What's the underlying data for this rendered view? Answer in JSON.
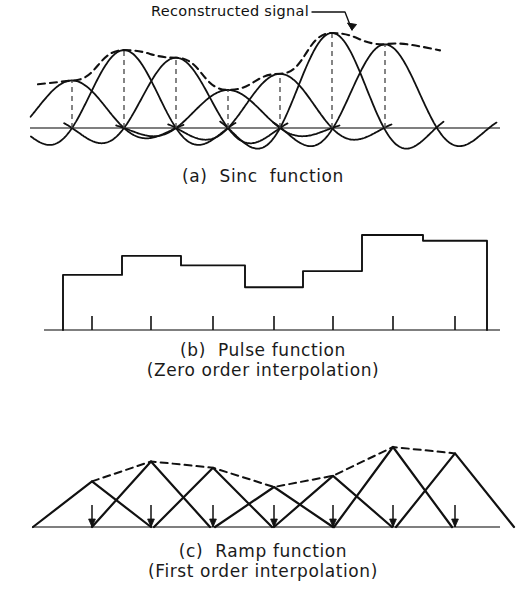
{
  "figure": {
    "stroke_color": "#111111",
    "dashed_color": "#111111",
    "baseline_color": "#555555"
  },
  "annotations": {
    "reconstructed_signal": {
      "text": "Reconstructed signal",
      "leader": "line-with-arrow"
    }
  },
  "panels": [
    {
      "id": "a",
      "caption_line1": "(a)  Sinc  function",
      "caption_line2": "",
      "type": "sinc",
      "baseline_y": 128,
      "sample_x": [
        72,
        124,
        176,
        228,
        280,
        332,
        385
      ],
      "sample_amplitude": [
        50,
        82,
        74,
        40,
        57,
        100,
        88
      ],
      "has_dashed_envelope": true,
      "has_dashed_stems": true,
      "axis_x_start": 30,
      "axis_x_end": 500
    },
    {
      "id": "b",
      "caption_line1": "(b)  Pulse function",
      "caption_line2": "(Zero order interpolation)",
      "type": "pulse",
      "baseline_y": 330,
      "bar_edges": [
        63,
        122,
        181,
        245,
        303,
        362,
        423,
        487
      ],
      "bar_heights": [
        58,
        78,
        68,
        45,
        62,
        100,
        94
      ],
      "tick_x": [
        92,
        151,
        213,
        274,
        333,
        393,
        455
      ],
      "axis_x_start": 44,
      "axis_x_end": 500
    },
    {
      "id": "c",
      "caption_line1": "(c)  Ramp function",
      "caption_line2": "(First order interpolation)",
      "type": "ramp",
      "baseline_y": 527,
      "sample_x": [
        92,
        151,
        213,
        274,
        333,
        393,
        455
      ],
      "sample_amplitude": [
        57,
        82,
        74,
        50,
        64,
        100,
        92
      ],
      "has_dashed_envelope": true,
      "arrow_ticks": true,
      "axis_x_start": 32,
      "axis_x_end": 500
    }
  ]
}
